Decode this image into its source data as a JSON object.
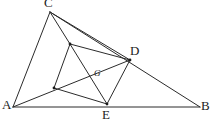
{
  "figure": {
    "background_color": "#ffffff",
    "stroke_color": "#2b2b2b",
    "label_color": "#1b1b1b",
    "width": 214,
    "height": 122,
    "vertices": [
      {
        "id": "A",
        "label": "A",
        "x": 13,
        "y": 107,
        "label_x": 2,
        "label_y": 98,
        "label_size": "normal"
      },
      {
        "id": "B",
        "label": "B",
        "x": 200,
        "y": 107,
        "label_x": 201,
        "label_y": 99,
        "label_size": "normal"
      },
      {
        "id": "C",
        "label": "C",
        "x": 50,
        "y": 12,
        "label_x": 44,
        "label_y": -4,
        "label_size": "normal"
      },
      {
        "id": "D",
        "label": "D",
        "x": 130,
        "y": 60,
        "label_x": 130,
        "label_y": 44,
        "label_size": "normal"
      },
      {
        "id": "E",
        "label": "E",
        "x": 107,
        "y": 104,
        "label_x": 102,
        "label_y": 108,
        "label_size": "normal"
      },
      {
        "id": "F",
        "label": "",
        "x": 70,
        "y": 44,
        "label_x": 0,
        "label_y": 0,
        "label_size": "normal"
      },
      {
        "id": "H",
        "label": "",
        "x": 54,
        "y": 88,
        "label_x": 0,
        "label_y": 0,
        "label_size": "normal"
      },
      {
        "id": "G",
        "label": "G",
        "x": 99,
        "y": 76,
        "label_x": 94,
        "label_y": 69,
        "label_size": "small"
      }
    ],
    "edges": [
      {
        "name": "segment-A-B",
        "x1": 13,
        "y1": 107,
        "x2": 200,
        "y2": 107
      },
      {
        "name": "segment-A-C",
        "x1": 13,
        "y1": 107,
        "x2": 50,
        "y2": 12
      },
      {
        "name": "segment-C-B",
        "x1": 50,
        "y1": 12,
        "x2": 200,
        "y2": 107
      },
      {
        "name": "segment-C-F",
        "x1": 50,
        "y1": 12,
        "x2": 70,
        "y2": 44
      },
      {
        "name": "segment-C-D",
        "x1": 50,
        "y1": 12,
        "x2": 130,
        "y2": 60
      },
      {
        "name": "segment-F-D",
        "x1": 70,
        "y1": 44,
        "x2": 130,
        "y2": 60
      },
      {
        "name": "segment-F-H",
        "x1": 70,
        "y1": 44,
        "x2": 54,
        "y2": 88
      },
      {
        "name": "segment-H-E",
        "x1": 54,
        "y1": 88,
        "x2": 107,
        "y2": 104
      },
      {
        "name": "segment-E-D",
        "x1": 107,
        "y1": 104,
        "x2": 130,
        "y2": 60
      },
      {
        "name": "segment-F-E",
        "x1": 70,
        "y1": 44,
        "x2": 107,
        "y2": 104
      },
      {
        "name": "segment-A-D",
        "x1": 13,
        "y1": 107,
        "x2": 130,
        "y2": 60
      }
    ],
    "nodes": [
      {
        "name": "node-F",
        "x": 70,
        "y": 44
      },
      {
        "name": "node-H",
        "x": 54,
        "y": 88
      },
      {
        "name": "node-D",
        "x": 130,
        "y": 60
      },
      {
        "name": "node-E",
        "x": 107,
        "y": 104
      }
    ]
  }
}
